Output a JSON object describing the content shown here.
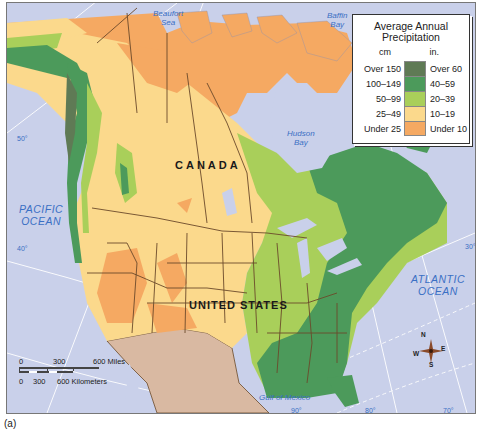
{
  "map": {
    "title": "Average Annual Precipitation",
    "countries": [
      "CANADA",
      "UNITED STATES"
    ],
    "water_labels": {
      "beaufort": "Beaufort\nSea",
      "baffin": "Baffin\nBay",
      "hudson": "Hudson\nBay",
      "pacific": "PACIFIC\nOCEAN",
      "atlantic": "ATLANTIC\nOCEAN",
      "gulf": "Gulf of Mexico"
    },
    "graticule_labels": [
      "50°",
      "40°",
      "30°",
      "90°",
      "80°",
      "70°"
    ]
  },
  "legend": {
    "title_line1": "Average Annual",
    "title_line2": "Precipitation",
    "unit_cm": "cm",
    "unit_in": "in.",
    "rows": [
      {
        "cm": "Over 150",
        "in": "Over 60",
        "color": "#5f7a55"
      },
      {
        "cm": "100–149",
        "in": "40–59",
        "color": "#4c9a5b"
      },
      {
        "cm": "50–99",
        "in": "20–39",
        "color": "#a9cf5a"
      },
      {
        "cm": "25–49",
        "in": "10–19",
        "color": "#fbd98c"
      },
      {
        "cm": "Under 25",
        "in": "Under 10",
        "color": "#f5a962"
      }
    ]
  },
  "scale_bar": {
    "miles": [
      "0",
      "300",
      "600 Miles"
    ],
    "km": [
      "0",
      "300",
      "600 Kilometers"
    ]
  },
  "compass": {
    "n": "N",
    "s": "S",
    "e": "E",
    "w": "W"
  },
  "caption": "(a)",
  "colors": {
    "water": "#c9d0ea",
    "mexico": "#d9b9a2",
    "border": "#6b4a2a",
    "graticule": "#ffffff"
  }
}
